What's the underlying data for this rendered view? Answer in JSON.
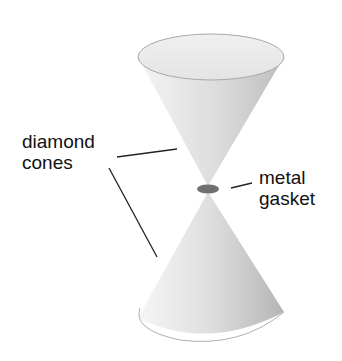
{
  "diagram": {
    "labels": {
      "left": [
        "diamond",
        "cones"
      ],
      "right": [
        "metal",
        "gasket"
      ]
    },
    "components": [
      "upper-diamond-cone",
      "lower-diamond-cone",
      "metal-gasket"
    ],
    "colors": {
      "cone_light": "#f2f2f2",
      "cone_dark": "#b8b8b8",
      "gasket": "#707070",
      "leader": "#222222"
    }
  }
}
